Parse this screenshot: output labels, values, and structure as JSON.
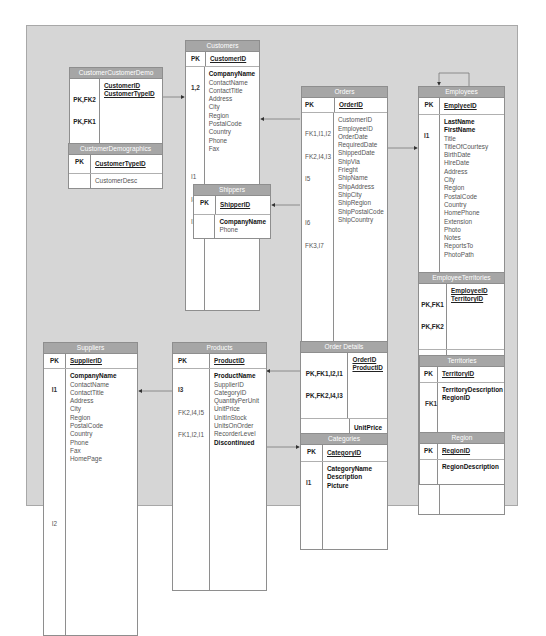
{
  "diagram": {
    "colors": {
      "canvas": "#d6d6d6",
      "table_header": "#a6a6a6",
      "table_body": "#ffffff",
      "border": "#8e8e8e",
      "line": "#777777"
    },
    "tables": {
      "customers": {
        "name": "Customers",
        "pk": {
          "key": "PK",
          "column": "CustomerID"
        },
        "fields": [
          {
            "key": "1,2",
            "column": "CompanyName",
            "bold": true
          },
          {
            "key": "",
            "column": "ContactName"
          },
          {
            "key": "",
            "column": "ContactTitle"
          },
          {
            "key": "",
            "column": "Address"
          },
          {
            "key": "I1",
            "column": "City"
          },
          {
            "key": "I4",
            "column": "Region"
          },
          {
            "key": "I3",
            "column": "PostalCode"
          },
          {
            "key": "",
            "column": "Country"
          },
          {
            "key": "",
            "column": "Phone"
          },
          {
            "key": "",
            "column": "Fax"
          }
        ]
      },
      "customer_customer_demo": {
        "name": "CustomerCustomerDemo",
        "pk": [
          {
            "key": "PK,FK2",
            "column": "CustomerID"
          },
          {
            "key": "PK,FK1",
            "column": "CustomerTypeID"
          }
        ],
        "fields": []
      },
      "customer_demographics": {
        "name": "CustomerDemographics",
        "pk": {
          "key": "PK",
          "column": "CustomerTypeID"
        },
        "fields": [
          {
            "key": "",
            "column": "CustomerDesc"
          }
        ]
      },
      "shippers": {
        "name": "Shippers",
        "pk": {
          "key": "PK",
          "column": "ShipperID"
        },
        "fields": [
          {
            "key": "",
            "column": "CompanyName",
            "bold": true
          },
          {
            "key": "",
            "column": "Phone"
          }
        ]
      },
      "orders": {
        "name": "Orders",
        "pk": {
          "key": "PK",
          "column": "OrderID"
        },
        "fields": [
          {
            "key": "FK1,I1,I2",
            "column": "CustomerID"
          },
          {
            "key": "FK2,I4,I3",
            "column": "EmployeeID"
          },
          {
            "key": "I5",
            "column": "OrderDate"
          },
          {
            "key": "",
            "column": "RequiredDate"
          },
          {
            "key": "I6",
            "column": "ShippedDate"
          },
          {
            "key": "FK3,I7",
            "column": "ShipVia"
          },
          {
            "key": "",
            "column": "Frieght"
          },
          {
            "key": "",
            "column": "ShipName"
          },
          {
            "key": "",
            "column": "ShipAddress"
          },
          {
            "key": "",
            "column": "ShipCity"
          },
          {
            "key": "",
            "column": "ShipRegion"
          },
          {
            "key": "I8",
            "column": "ShipPostalCode"
          },
          {
            "key": "",
            "column": "ShipCountry"
          }
        ]
      },
      "employees": {
        "name": "Employees",
        "pk": {
          "key": "PK",
          "column": "EmplyeeID"
        },
        "fields": [
          {
            "key": "I1",
            "column": "LastName",
            "bold": true
          },
          {
            "key": "",
            "column": "FirstName",
            "bold": true
          },
          {
            "key": "",
            "column": "Title"
          },
          {
            "key": "",
            "column": "TitleOfCourtesy"
          },
          {
            "key": "",
            "column": "BirthDate"
          },
          {
            "key": "",
            "column": "HireDate"
          },
          {
            "key": "",
            "column": "Address"
          },
          {
            "key": "",
            "column": "City"
          },
          {
            "key": "",
            "column": "Region"
          },
          {
            "key": "I2",
            "column": "PostalCode"
          },
          {
            "key": "",
            "column": "Country"
          },
          {
            "key": "",
            "column": "HomePhone"
          },
          {
            "key": "",
            "column": "Extension"
          },
          {
            "key": "",
            "column": "Photo"
          },
          {
            "key": "",
            "column": "Notes"
          },
          {
            "key": "FK1",
            "column": "ReportsTo"
          },
          {
            "key": "",
            "column": "PhotoPath"
          }
        ]
      },
      "employee_territories": {
        "name": "EmployeeTerritories",
        "pk": [
          {
            "key": "PK,FK1",
            "column": "EmployeeID"
          },
          {
            "key": "PK,FK2",
            "column": "TerritoryID"
          }
        ],
        "fields": []
      },
      "territories": {
        "name": "Territories",
        "pk": {
          "key": "PK",
          "column": "TerritoryID"
        },
        "fields": [
          {
            "key": "FK1",
            "column": "TerritoryDescription",
            "bold": true
          },
          {
            "key": "",
            "column": "RegionID",
            "bold": true
          }
        ]
      },
      "region": {
        "name": "Region",
        "pk": {
          "key": "PK",
          "column": "RegionID"
        },
        "fields": [
          {
            "key": "",
            "column": "RegionDescription",
            "bold": true
          }
        ]
      },
      "suppliers": {
        "name": "Suppliers",
        "pk": {
          "key": "PK",
          "column": "SupplierID"
        },
        "fields": [
          {
            "key": "I1",
            "column": "CompanyName",
            "bold": true
          },
          {
            "key": "",
            "column": "ContactName"
          },
          {
            "key": "",
            "column": "ContactTitle"
          },
          {
            "key": "",
            "column": "Address"
          },
          {
            "key": "",
            "column": "City"
          },
          {
            "key": "",
            "column": "Region"
          },
          {
            "key": "I2",
            "column": "PostalCode"
          },
          {
            "key": "",
            "column": "Country"
          },
          {
            "key": "",
            "column": "Phone"
          },
          {
            "key": "",
            "column": "Fax"
          },
          {
            "key": "",
            "column": "HomePage"
          }
        ]
      },
      "products": {
        "name": "Products",
        "pk": {
          "key": "PK",
          "column": "ProductID"
        },
        "fields": [
          {
            "key": "I3",
            "column": "ProductName",
            "bold": true
          },
          {
            "key": "FK2,I4,I5",
            "column": "SupplierID"
          },
          {
            "key": "FK1,I2,I1",
            "column": "CategoryID"
          },
          {
            "key": "",
            "column": "QuantityPerUnit"
          },
          {
            "key": "",
            "column": "UnitPrice"
          },
          {
            "key": "",
            "column": "UnitInStock"
          },
          {
            "key": "",
            "column": "UnitsOnOrder"
          },
          {
            "key": "",
            "column": "RecorderLevel"
          },
          {
            "key": "",
            "column": "Discontinued",
            "bold": true
          }
        ]
      },
      "order_details": {
        "name": "Order Details",
        "pk": [
          {
            "key": "PK,FK1,I2,I1",
            "column": "OrderID"
          },
          {
            "key": "PK,FK2,I4,I3",
            "column": "ProductID"
          }
        ],
        "fields": [
          {
            "key": "",
            "column": "UnitPrice",
            "bold": true
          },
          {
            "key": "",
            "column": "Quantity",
            "bold": true
          },
          {
            "key": "",
            "column": "Discount",
            "bold": true
          }
        ]
      },
      "categories": {
        "name": "Categories",
        "pk": {
          "key": "PK",
          "column": "CategoryID"
        },
        "fields": [
          {
            "key": "I1",
            "column": "CategoryName",
            "bold": true
          },
          {
            "key": "",
            "column": "Description",
            "bold": true
          },
          {
            "key": "",
            "column": "Picture",
            "bold": true
          }
        ]
      }
    },
    "relationships": [
      {
        "from": "CustomerCustomerDemo",
        "to": "Customers"
      },
      {
        "from": "CustomerCustomerDemo",
        "to": "CustomerDemographics"
      },
      {
        "from": "Orders",
        "to": "Customers"
      },
      {
        "from": "Orders",
        "to": "Employees"
      },
      {
        "from": "Orders",
        "to": "Shippers"
      },
      {
        "from": "Employees",
        "to": "Employees"
      },
      {
        "from": "EmployeeTerritories",
        "to": "Employees"
      },
      {
        "from": "EmployeeTerritories",
        "to": "Territories"
      },
      {
        "from": "Territories",
        "to": "Region"
      },
      {
        "from": "Order Details",
        "to": "Orders"
      },
      {
        "from": "Order Details",
        "to": "Products"
      },
      {
        "from": "Products",
        "to": "Suppliers"
      },
      {
        "from": "Products",
        "to": "Categories"
      }
    ]
  }
}
